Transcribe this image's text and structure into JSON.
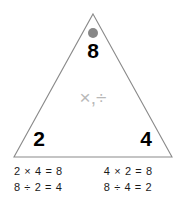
{
  "figure": {
    "type": "fact-family-triangle",
    "triangle": {
      "apex_dot_color": "#878787",
      "outline_color": "#8a8a8a",
      "product_number": "8",
      "left_factor": "2",
      "right_factor": "4",
      "operators_label": "×,÷",
      "operators_color": "#b8b8b8"
    },
    "equations": {
      "left_column": [
        "2 × 4 = 8",
        "8 ÷ 2 = 4"
      ],
      "right_column": [
        "4 × 2 = 8",
        "8 ÷ 4 = 2"
      ]
    }
  }
}
